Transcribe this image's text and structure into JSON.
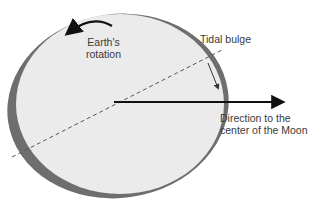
{
  "diagram": {
    "labels": {
      "rotation_line1": "Earth's",
      "rotation_line2": "rotation",
      "tidal_bulge": "Tidal bulge",
      "moon_line1": "Direction to the",
      "moon_line2": "center of the Moon"
    },
    "colors": {
      "earth_fill": "#ebebeb",
      "bulge_shade": "#6e6e6e",
      "arrow": "#111111",
      "text": "#3a3a3a"
    }
  }
}
